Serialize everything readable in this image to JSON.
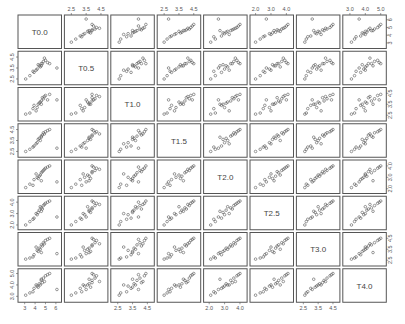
{
  "chart_data": {
    "type": "scatter",
    "subtype": "scatterplot-matrix",
    "title": "",
    "variables": [
      "T0.0",
      "T0.5",
      "T1.0",
      "T1.5",
      "T2.0",
      "T2.5",
      "T3.0",
      "T4.0"
    ],
    "axis_ranges": {
      "T0.0": [
        2.6,
        6.3
      ],
      "T0.5": [
        2.2,
        4.8
      ],
      "T1.0": [
        2.2,
        4.8
      ],
      "T1.5": [
        2.2,
        4.8
      ],
      "T2.0": [
        1.8,
        4.3
      ],
      "T2.5": [
        1.8,
        4.3
      ],
      "T3.0": [
        2.2,
        4.8
      ],
      "T4.0": [
        2.7,
        5.2
      ]
    },
    "axis_ticks": {
      "T0.0": [
        "3",
        "4",
        "5",
        "6"
      ],
      "T0.5": [
        "2.5",
        "3.5",
        "4.5"
      ],
      "T1.0": [
        "2.5",
        "3.5",
        "4.5"
      ],
      "T1.5": [
        "2.5",
        "3.5",
        "4.5"
      ],
      "T2.0": [
        "2.0",
        "3.0",
        "4.0"
      ],
      "T2.5": [
        "2.0",
        "3.0",
        "4.0"
      ],
      "T3.0": [
        "2.5",
        "3.5",
        "4.5"
      ],
      "T4.0": [
        "3.0",
        "4.0",
        "5.0"
      ]
    },
    "tick_placement": {
      "top": [
        1,
        3,
        5,
        7
      ],
      "bottom": [
        0,
        2,
        4,
        6
      ],
      "left": [
        1,
        3,
        5,
        7
      ],
      "right": [
        0,
        2,
        4,
        6
      ]
    },
    "observations": [
      [
        4.6,
        3.9,
        3.8,
        3.9,
        3.4,
        3.5,
        3.9,
        4.4
      ],
      [
        4.8,
        4.1,
        4.0,
        4.2,
        3.6,
        3.7,
        4.1,
        4.6
      ],
      [
        4.4,
        3.7,
        3.6,
        3.7,
        3.1,
        3.3,
        3.6,
        4.1
      ],
      [
        5.0,
        4.2,
        4.3,
        4.3,
        3.8,
        3.9,
        4.3,
        4.8
      ],
      [
        4.7,
        3.9,
        4.1,
        4.0,
        3.5,
        3.4,
        3.8,
        4.2
      ],
      [
        3.1,
        2.5,
        2.6,
        2.5,
        2.1,
        2.0,
        2.6,
        3.1
      ],
      [
        3.5,
        2.8,
        2.7,
        2.7,
        2.4,
        2.3,
        2.7,
        3.3
      ],
      [
        4.2,
        3.4,
        3.2,
        3.3,
        3.0,
        2.9,
        3.4,
        3.9
      ],
      [
        5.2,
        4.0,
        3.9,
        4.4,
        3.9,
        4.0,
        4.4,
        4.9
      ],
      [
        3.9,
        3.1,
        3.4,
        3.0,
        2.8,
        2.6,
        3.0,
        3.7
      ],
      [
        4.5,
        3.6,
        3.7,
        3.5,
        3.2,
        3.6,
        3.5,
        4.0
      ],
      [
        4.9,
        4.4,
        4.2,
        4.1,
        3.7,
        3.8,
        4.0,
        4.3
      ],
      [
        4.3,
        3.8,
        3.5,
        3.6,
        2.9,
        3.1,
        3.3,
        3.8
      ],
      [
        6.1,
        3.5,
        3.9,
        2.8,
        2.6,
        2.7,
        3.1,
        3.6
      ],
      [
        4.1,
        3.3,
        2.9,
        3.2,
        3.3,
        3.0,
        3.7,
        4.0
      ],
      [
        5.4,
        3.9,
        4.4,
        4.5,
        4.0,
        4.1,
        4.5,
        5.0
      ],
      [
        3.8,
        3.2,
        3.1,
        2.9,
        2.3,
        2.5,
        2.8,
        3.4
      ],
      [
        4.6,
        3.7,
        3.5,
        3.8,
        2.7,
        3.2,
        3.2,
        4.5
      ]
    ],
    "point_marker": "open-circle",
    "grid": false,
    "legend": "none"
  }
}
